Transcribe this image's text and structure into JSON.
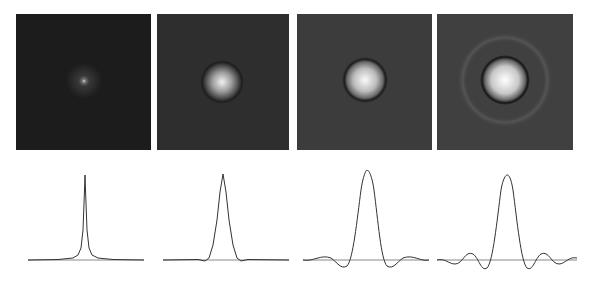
{
  "figure": {
    "panels": [
      {
        "id": "a",
        "background": "#1c1c1c",
        "core_radius": 4,
        "halo_radius": 16,
        "ring": false
      },
      {
        "id": "b",
        "background": "#2e2e2e",
        "core_radius": 12,
        "halo_radius": 17,
        "ring": false
      },
      {
        "id": "c",
        "background": "#3c3c3c",
        "core_radius": 14,
        "halo_radius": 18,
        "ring": false
      },
      {
        "id": "d",
        "background": "#404040",
        "core_radius": 15,
        "halo_radius": 20,
        "ring": true
      }
    ],
    "profiles": [
      {
        "id": "a",
        "shape": "cusp",
        "peak_height": 0.82,
        "width": 0.05,
        "sidelobes": 0.0
      },
      {
        "id": "b",
        "shape": "gaussian",
        "peak_height": 0.95,
        "width": 0.16,
        "sidelobes": 0.02
      },
      {
        "id": "c",
        "shape": "sinc",
        "peak_height": 1.0,
        "width": 0.22,
        "sidelobes": 0.08
      },
      {
        "id": "d",
        "shape": "sinc",
        "peak_height": 0.94,
        "width": 0.24,
        "sidelobes": 0.12
      }
    ]
  }
}
